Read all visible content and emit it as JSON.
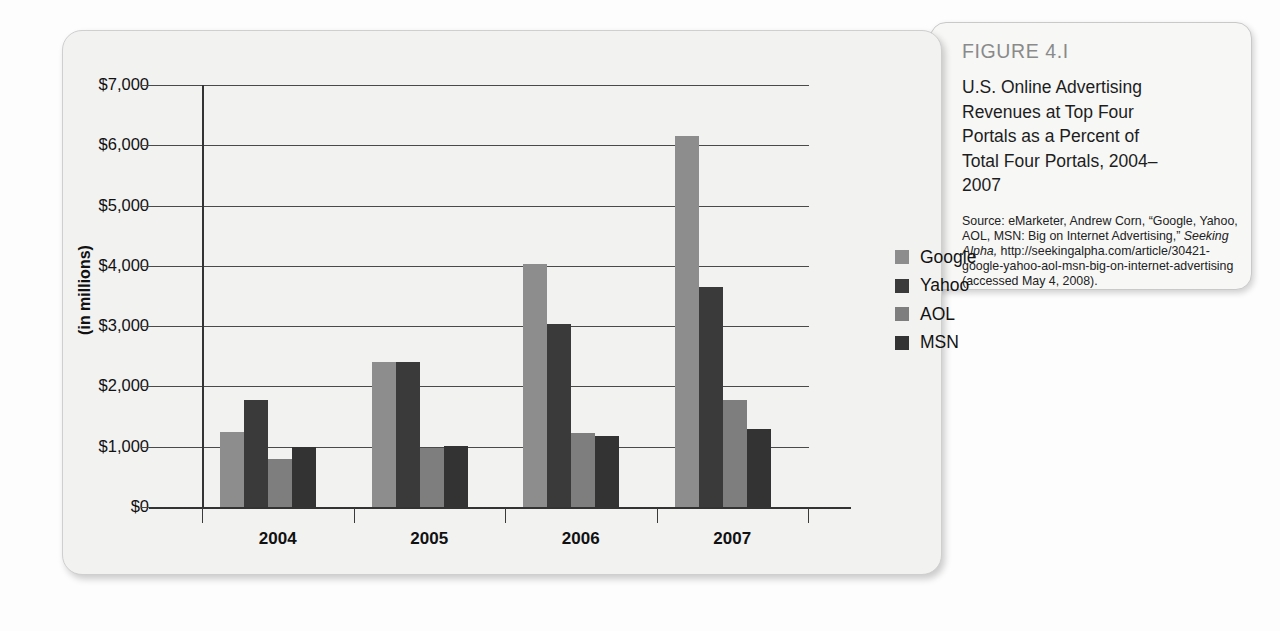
{
  "figure": {
    "label": "FIGURE 4.I",
    "title": "U.S. Online Advertising Revenues at Top Four Portals as a Percent of Total Four Portals, 2004–2007",
    "source_lines": [
      "Source: eMarketer, Andrew",
      "Corn, “Google, Yahoo,",
      "AOL, MSN: Big on Internet",
      "Advertising,” ",
      "Seeking Alpha,",
      "http://seekingalpha.com/",
      "article/30421-google-yahoo-aol-",
      "msn-big-on-internet-advertising",
      "(accessed May 4, 2008)."
    ],
    "source_plain_1": "Source: eMarketer, Andrew Corn, “Google, Yahoo, AOL, MSN: Big on Internet Advertising,” ",
    "source_italic": "Seeking Alpha,",
    "source_plain_2": " http://seekingalpha.com/article/30421-google-yahoo-aol-msn-big-on-internet-advertising (accessed May 4, 2008)."
  },
  "chart_data": {
    "type": "bar",
    "title": "",
    "xlabel": "",
    "ylabel": "(in millions)",
    "categories": [
      "2004",
      "2005",
      "2006",
      "2007"
    ],
    "series": [
      {
        "name": "Google",
        "color": "#8d8d8d",
        "values": [
          1250,
          2400,
          4030,
          6150
        ]
      },
      {
        "name": "Yahoo",
        "color": "#3a3a3a",
        "values": [
          1770,
          2400,
          3030,
          3650
        ]
      },
      {
        "name": "AOL",
        "color": "#7e7e7e",
        "values": [
          800,
          980,
          1230,
          1780
        ]
      },
      {
        "name": "MSN",
        "color": "#333333",
        "values": [
          1000,
          1020,
          1170,
          1300
        ]
      }
    ],
    "ylim": [
      0,
      7000
    ],
    "ytick_values": [
      0,
      1000,
      2000,
      3000,
      4000,
      5000,
      6000,
      7000
    ],
    "ytick_labels": [
      "$0",
      "$1,000",
      "$2,000",
      "$3,000",
      "$4,000",
      "$5,000",
      "$6,000",
      "$7,000"
    ],
    "grid": true,
    "legend_position": "right",
    "legend_entries": [
      "Google",
      "Yahoo",
      "AOL",
      "MSN"
    ]
  },
  "colors": {
    "card_background": "#f2f2f1",
    "card_border": "#cfcfcf",
    "axis": "#333333",
    "gridline": "#4a4a4a",
    "figure_label": "#8a8a8a",
    "text": "#111111"
  }
}
